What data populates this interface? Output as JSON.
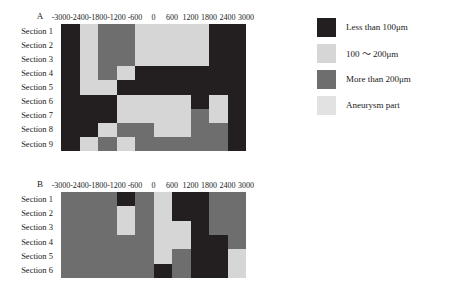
{
  "figure": {
    "panels": [
      {
        "id": "A",
        "letter": "A",
        "row_labels": [
          "Section 1",
          "Section 2",
          "Section 3",
          "Section 4",
          "Section 5",
          "Section 6",
          "Section 7",
          "Section 8",
          "Section 9"
        ],
        "tick_labels": [
          "-3000",
          "-2400",
          "-1800",
          "-1200",
          "-600",
          "0",
          "600",
          "1200",
          "1800",
          "2400",
          "3000"
        ]
      },
      {
        "id": "B",
        "letter": "B",
        "row_labels": [
          "Section 1",
          "Section 2",
          "Section 3",
          "Section 4",
          "Section 5",
          "Section 6"
        ],
        "tick_labels": [
          "-3000",
          "-2400",
          "-1800",
          "-1200",
          "-600",
          "0",
          "600",
          "1200",
          "1800",
          "2400",
          "3000"
        ]
      }
    ]
  },
  "legend": {
    "items": [
      {
        "label": "Less than 100μm",
        "color": "#231f20",
        "key": "lt100"
      },
      {
        "label": "100 ～ 200μm",
        "color": "#d6d6d6",
        "key": "100_200"
      },
      {
        "label": "More than 200μm",
        "color": "#6e6e6e",
        "key": "gt200"
      },
      {
        "label": "Aneurysm part",
        "color": "#e2e2e2",
        "key": "aneurysm"
      }
    ]
  },
  "chart_data": {
    "type": "heatmap",
    "title": "",
    "xlabel": "",
    "ylabel": "",
    "grid": false,
    "legend_position": "right",
    "color_map": {
      "lt100": "#231f20",
      "100_200": "#d6d6d6",
      "gt200": "#6e6e6e",
      "aneurysm": "#e2e2e2",
      "blank": "#ffffff"
    },
    "panels": [
      {
        "id": "A",
        "x": [
          -3000,
          -2400,
          -1800,
          -1200,
          -600,
          0,
          600,
          1200,
          1800,
          2400,
          3000
        ],
        "x_bin_edges": [
          -3000,
          -2400,
          -1800,
          -1200,
          -600,
          0,
          600,
          1200,
          1800,
          2400,
          3000
        ],
        "rows": [
          "Section 1",
          "Section 2",
          "Section 3",
          "Section 4",
          "Section 5",
          "Section 6",
          "Section 7",
          "Section 8",
          "Section 9"
        ],
        "values": [
          [
            "lt100",
            "100_200",
            "gt200",
            "gt200",
            "100_200",
            "100_200",
            "100_200",
            "100_200",
            "lt100",
            "lt100"
          ],
          [
            "lt100",
            "100_200",
            "gt200",
            "gt200",
            "100_200",
            "100_200",
            "100_200",
            "100_200",
            "lt100",
            "lt100"
          ],
          [
            "lt100",
            "100_200",
            "gt200",
            "gt200",
            "100_200",
            "100_200",
            "100_200",
            "100_200",
            "lt100",
            "lt100"
          ],
          [
            "lt100",
            "100_200",
            "gt200",
            "100_200",
            "lt100",
            "lt100",
            "lt100",
            "lt100",
            "lt100",
            "lt100"
          ],
          [
            "lt100",
            "100_200",
            "100_200",
            "lt100",
            "lt100",
            "lt100",
            "lt100",
            "lt100",
            "lt100",
            "lt100"
          ],
          [
            "lt100",
            "lt100",
            "lt100",
            "100_200",
            "100_200",
            "100_200",
            "100_200",
            "lt100",
            "100_200",
            "lt100"
          ],
          [
            "lt100",
            "lt100",
            "lt100",
            "100_200",
            "100_200",
            "100_200",
            "100_200",
            "gt200",
            "100_200",
            "lt100"
          ],
          [
            "lt100",
            "lt100",
            "100_200",
            "gt200",
            "gt200",
            "100_200",
            "100_200",
            "gt200",
            "gt200",
            "lt100"
          ],
          [
            "lt100",
            "100_200",
            "gt200",
            "100_200",
            "gt200",
            "gt200",
            "gt200",
            "gt200",
            "gt200",
            "lt100"
          ]
        ]
      },
      {
        "id": "B",
        "x": [
          -3000,
          -2400,
          -1800,
          -1200,
          -600,
          0,
          600,
          1200,
          1800,
          2400,
          3000
        ],
        "x_bin_edges": [
          -3000,
          -2400,
          -1800,
          -1200,
          -600,
          0,
          600,
          1200,
          1800,
          2400,
          3000
        ],
        "rows": [
          "Section 1",
          "Section 2",
          "Section 3",
          "Section 4",
          "Section 5",
          "Section 6"
        ],
        "values": [
          [
            "gt200",
            "gt200",
            "gt200",
            "lt100",
            "gt200",
            "100_200",
            "lt100",
            "lt100",
            "gt200",
            "gt200"
          ],
          [
            "gt200",
            "gt200",
            "gt200",
            "100_200",
            "gt200",
            "100_200",
            "lt100",
            "lt100",
            "gt200",
            "gt200"
          ],
          [
            "gt200",
            "gt200",
            "gt200",
            "100_200",
            "gt200",
            "100_200",
            "100_200",
            "lt100",
            "gt200",
            "gt200"
          ],
          [
            "gt200",
            "gt200",
            "gt200",
            "gt200",
            "gt200",
            "100_200",
            "100_200",
            "lt100",
            "lt100",
            "gt200"
          ],
          [
            "gt200",
            "gt200",
            "gt200",
            "gt200",
            "gt200",
            "100_200",
            "gt200",
            "lt100",
            "lt100",
            "100_200"
          ],
          [
            "gt200",
            "gt200",
            "gt200",
            "gt200",
            "gt200",
            "lt100",
            "gt200",
            "lt100",
            "lt100",
            "100_200"
          ]
        ]
      }
    ]
  }
}
